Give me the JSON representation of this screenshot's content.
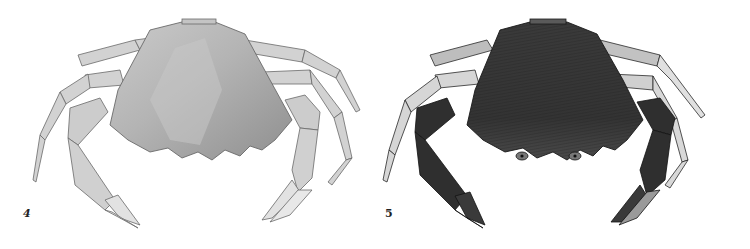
{
  "plate": {
    "figures": [
      {
        "label": "4",
        "subject": "crab, dorsal view, light watercolor wash",
        "colors": {
          "carapace": "#a8a8a8",
          "carapace_light": "#c9c9c9",
          "carapace_dark": "#8e8e8e",
          "legs": "#cfcfcf",
          "outline": "#6a6a6a"
        }
      },
      {
        "label": "5",
        "subject": "crab, dorsal view, dark engraved shading",
        "colors": {
          "carapace": "#3c3c3c",
          "carapace_dark": "#262626",
          "legs": "#d8d8d8",
          "claws": "#2e2e2e",
          "outline": "#1a1a1a"
        }
      }
    ]
  }
}
